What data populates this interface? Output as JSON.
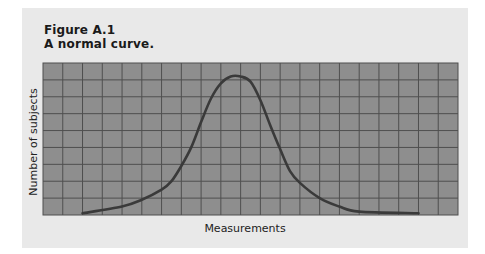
{
  "figure": {
    "label": "Figure A.1",
    "title": "A normal curve."
  },
  "chart_data": {
    "type": "line",
    "title": "A normal curve.",
    "figure_label": "Figure A.1",
    "xlabel": "Measurements",
    "ylabel": "Number of subjects",
    "grid": true,
    "grid_columns": 21,
    "grid_rows": 9,
    "tick_labels": false,
    "legend": null,
    "series": [
      {
        "name": "normal curve",
        "x": [
          2,
          4,
          5,
          6,
          6.5,
          7,
          7.5,
          8,
          8.5,
          9,
          9.5,
          10,
          10.5,
          11,
          11.5,
          12,
          12.5,
          13,
          14,
          15,
          16,
          19
        ],
        "y": [
          0.1,
          0.5,
          0.9,
          1.5,
          2.0,
          2.9,
          4.0,
          5.5,
          6.9,
          7.8,
          8.2,
          8.2,
          7.9,
          6.8,
          5.3,
          3.9,
          2.6,
          1.9,
          1.0,
          0.5,
          0.2,
          0.1
        ]
      }
    ],
    "colors": {
      "panel": "#e9e9e9",
      "grid_fill": "#8e8e8e",
      "grid_lines": "#4f4f4f",
      "curve": "#3a3a3a"
    }
  }
}
